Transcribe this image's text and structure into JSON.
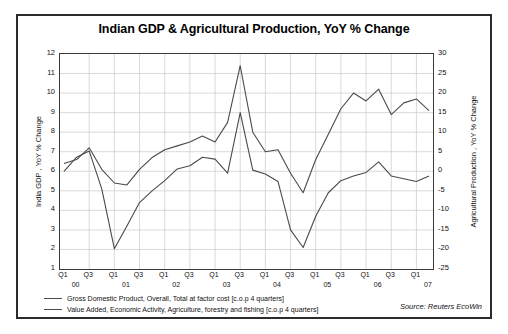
{
  "chart_data": {
    "type": "line",
    "title": "Indian GDP & Agricultural Production, YoY % Change",
    "xlabel": "",
    "ylabel": "India GDP , YoY % Change",
    "ylabel_right": "Agricultural Production , YoY % Change",
    "ylim": [
      1,
      12
    ],
    "ylim_right": [
      -25,
      30
    ],
    "yticks": [
      12,
      11,
      10,
      9,
      8,
      7,
      6,
      5,
      4,
      3,
      2,
      1
    ],
    "yticks_right": [
      30,
      25,
      20,
      15,
      10,
      5,
      0,
      -5,
      -10,
      -15,
      -20,
      -25
    ],
    "grid": true,
    "legend_position": "below",
    "x": [
      "Q1 00",
      "Q2 00",
      "Q3 00",
      "Q4 00",
      "Q1 01",
      "Q2 01",
      "Q3 01",
      "Q4 01",
      "Q1 02",
      "Q2 02",
      "Q3 02",
      "Q4 02",
      "Q1 03",
      "Q2 03",
      "Q3 03",
      "Q4 03",
      "Q1 04",
      "Q2 04",
      "Q3 04",
      "Q4 04",
      "Q1 05",
      "Q2 05",
      "Q3 05",
      "Q4 05",
      "Q1 06",
      "Q2 06",
      "Q3 06",
      "Q4 06",
      "Q1 07",
      "Q2 07"
    ],
    "xtick_labels": [
      "Q1",
      "Q3",
      "Q1",
      "Q3",
      "Q1",
      "Q3",
      "Q1",
      "Q3",
      "Q1",
      "Q3",
      "Q1",
      "Q3",
      "Q1",
      "Q3",
      "Q1"
    ],
    "xtick_years": [
      "00",
      "01",
      "02",
      "03",
      "04",
      "05",
      "06",
      "07"
    ],
    "series": [
      {
        "name": "Gross Domestic Product, Overall, Total at factor cost [c.o.p 4 quarters]",
        "axis": "left",
        "color": "#4a4a4a",
        "values": [
          6.4,
          6.6,
          7.2,
          6.1,
          5.4,
          5.3,
          6.1,
          6.7,
          7.1,
          7.3,
          7.5,
          7.8,
          7.5,
          8.5,
          11.4,
          8.0,
          7.0,
          7.1,
          5.9,
          4.9,
          6.6,
          7.9,
          9.2,
          10.0,
          9.6,
          10.2,
          8.9,
          9.5,
          9.7,
          9.1
        ]
      },
      {
        "name": "Value Added, Economic Activity, Agriculture, forestry and fishing [c.o.p 4 quarters]",
        "axis": "right",
        "color": "#4a4a4a",
        "values": [
          0.0,
          3.6,
          5.2,
          -4.5,
          -19.8,
          -14.0,
          -8.0,
          -5.0,
          -2.4,
          0.6,
          1.4,
          3.6,
          3.1,
          -0.5,
          15.0,
          0.3,
          -0.7,
          -2.6,
          -15.0,
          -19.5,
          -11.5,
          -5.5,
          -2.4,
          -1.2,
          -0.3,
          2.4,
          -1.2,
          -1.9,
          -2.6,
          -1.2
        ]
      }
    ],
    "source": "Source: Reuters EcoWin"
  }
}
